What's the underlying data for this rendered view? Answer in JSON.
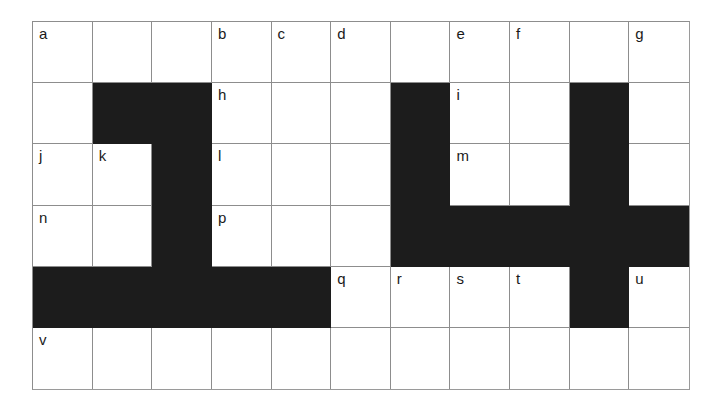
{
  "figure": {
    "type": "grid-diagram",
    "columns": 11,
    "rows": 6,
    "colors": {
      "background": "#ffffff",
      "blocked_cell": "#1c1c1c",
      "grid_line": "#8d8d8d",
      "label_text": "#1a1a1a"
    },
    "legend": {
      "blocked_symbol": "black-filled-cell",
      "open_symbol": "white-cell"
    }
  },
  "grid": {
    "rows": [
      {
        "index": 1,
        "cells": [
          {
            "col": 1,
            "state": "open",
            "label": "a"
          },
          {
            "col": 2,
            "state": "open",
            "label": ""
          },
          {
            "col": 3,
            "state": "open",
            "label": ""
          },
          {
            "col": 4,
            "state": "open",
            "label": "b"
          },
          {
            "col": 5,
            "state": "open",
            "label": "c"
          },
          {
            "col": 6,
            "state": "open",
            "label": "d"
          },
          {
            "col": 7,
            "state": "open",
            "label": ""
          },
          {
            "col": 8,
            "state": "open",
            "label": "e"
          },
          {
            "col": 9,
            "state": "open",
            "label": "f"
          },
          {
            "col": 10,
            "state": "open",
            "label": ""
          },
          {
            "col": 11,
            "state": "open",
            "label": "g"
          }
        ]
      },
      {
        "index": 2,
        "cells": [
          {
            "col": 1,
            "state": "open",
            "label": ""
          },
          {
            "col": 2,
            "state": "blocked",
            "label": ""
          },
          {
            "col": 3,
            "state": "blocked",
            "label": ""
          },
          {
            "col": 4,
            "state": "open",
            "label": "h"
          },
          {
            "col": 5,
            "state": "open",
            "label": ""
          },
          {
            "col": 6,
            "state": "open",
            "label": ""
          },
          {
            "col": 7,
            "state": "blocked",
            "label": ""
          },
          {
            "col": 8,
            "state": "open",
            "label": "i"
          },
          {
            "col": 9,
            "state": "open",
            "label": ""
          },
          {
            "col": 10,
            "state": "blocked",
            "label": ""
          },
          {
            "col": 11,
            "state": "open",
            "label": ""
          }
        ]
      },
      {
        "index": 3,
        "cells": [
          {
            "col": 1,
            "state": "open",
            "label": "j"
          },
          {
            "col": 2,
            "state": "open",
            "label": "k"
          },
          {
            "col": 3,
            "state": "blocked",
            "label": ""
          },
          {
            "col": 4,
            "state": "open",
            "label": "l"
          },
          {
            "col": 5,
            "state": "open",
            "label": ""
          },
          {
            "col": 6,
            "state": "open",
            "label": ""
          },
          {
            "col": 7,
            "state": "blocked",
            "label": ""
          },
          {
            "col": 8,
            "state": "open",
            "label": "m"
          },
          {
            "col": 9,
            "state": "open",
            "label": ""
          },
          {
            "col": 10,
            "state": "blocked",
            "label": ""
          },
          {
            "col": 11,
            "state": "open",
            "label": ""
          }
        ]
      },
      {
        "index": 4,
        "cells": [
          {
            "col": 1,
            "state": "open",
            "label": "n"
          },
          {
            "col": 2,
            "state": "open",
            "label": ""
          },
          {
            "col": 3,
            "state": "blocked",
            "label": ""
          },
          {
            "col": 4,
            "state": "open",
            "label": "p"
          },
          {
            "col": 5,
            "state": "open",
            "label": ""
          },
          {
            "col": 6,
            "state": "open",
            "label": ""
          },
          {
            "col": 7,
            "state": "blocked",
            "label": ""
          },
          {
            "col": 8,
            "state": "blocked",
            "label": ""
          },
          {
            "col": 9,
            "state": "blocked",
            "label": ""
          },
          {
            "col": 10,
            "state": "blocked",
            "label": ""
          },
          {
            "col": 11,
            "state": "blocked",
            "label": ""
          }
        ]
      },
      {
        "index": 5,
        "cells": [
          {
            "col": 1,
            "state": "blocked",
            "label": ""
          },
          {
            "col": 2,
            "state": "blocked",
            "label": ""
          },
          {
            "col": 3,
            "state": "blocked",
            "label": ""
          },
          {
            "col": 4,
            "state": "blocked",
            "label": ""
          },
          {
            "col": 5,
            "state": "blocked",
            "label": ""
          },
          {
            "col": 6,
            "state": "open",
            "label": "q"
          },
          {
            "col": 7,
            "state": "open",
            "label": "r"
          },
          {
            "col": 8,
            "state": "open",
            "label": "s"
          },
          {
            "col": 9,
            "state": "open",
            "label": "t"
          },
          {
            "col": 10,
            "state": "blocked",
            "label": ""
          },
          {
            "col": 11,
            "state": "open",
            "label": "u"
          }
        ]
      },
      {
        "index": 6,
        "cells": [
          {
            "col": 1,
            "state": "open",
            "label": "v"
          },
          {
            "col": 2,
            "state": "open",
            "label": ""
          },
          {
            "col": 3,
            "state": "open",
            "label": ""
          },
          {
            "col": 4,
            "state": "open",
            "label": ""
          },
          {
            "col": 5,
            "state": "open",
            "label": ""
          },
          {
            "col": 6,
            "state": "open",
            "label": ""
          },
          {
            "col": 7,
            "state": "open",
            "label": ""
          },
          {
            "col": 8,
            "state": "open",
            "label": ""
          },
          {
            "col": 9,
            "state": "open",
            "label": ""
          },
          {
            "col": 10,
            "state": "open",
            "label": ""
          },
          {
            "col": 11,
            "state": "open",
            "label": ""
          }
        ]
      }
    ]
  }
}
